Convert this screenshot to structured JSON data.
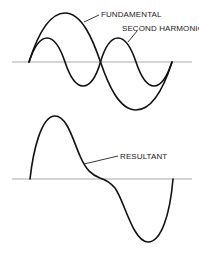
{
  "figure": {
    "top_panel": {
      "labels": {
        "fundamental": "FUNDAMENTAL",
        "second_harmonic": "SECOND HARMONIC"
      }
    },
    "bottom_panel": {
      "labels": {
        "resultant": "RESULTANT"
      }
    },
    "colors": {
      "curve": "#111111",
      "axis": "#a8a8a8",
      "background": "#ffffff"
    }
  }
}
